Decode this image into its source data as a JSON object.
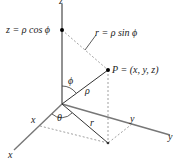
{
  "diagram": {
    "labels": {
      "z_axis": "z",
      "z_value": "z = ρ cos ϕ",
      "r_value": "r = ρ sin ϕ",
      "point": "P = (x, y, z)",
      "phi": "ϕ",
      "rho": "ρ",
      "theta": "θ",
      "r": "r",
      "x_tick": "x",
      "x_axis": "x",
      "y_tick": "y",
      "y_axis": "y"
    },
    "colors": {
      "axis": "#707070",
      "line": "#333333",
      "dashed": "#888888",
      "point": "#000000"
    }
  }
}
